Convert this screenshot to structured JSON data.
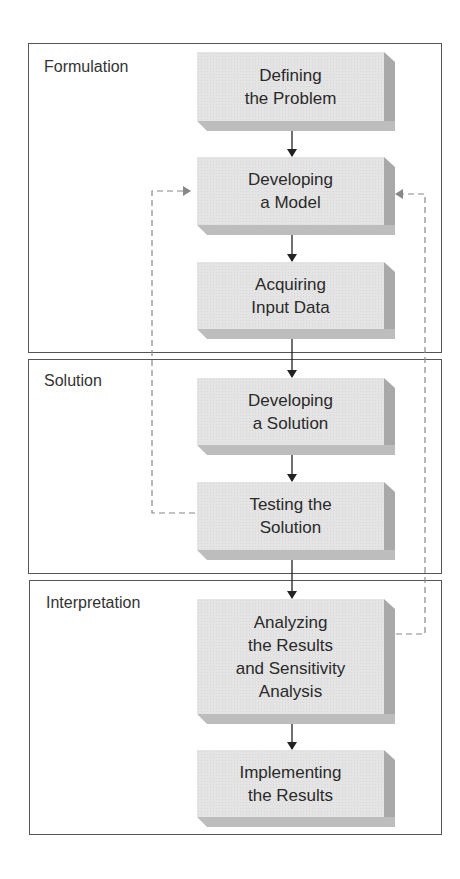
{
  "phases": [
    {
      "label": "Formulation"
    },
    {
      "label": "Solution"
    },
    {
      "label": "Interpretation"
    }
  ],
  "steps": [
    {
      "label": "Defining\nthe Problem"
    },
    {
      "label": "Developing\na Model"
    },
    {
      "label": "Acquiring\nInput Data"
    },
    {
      "label": "Developing\na Solution"
    },
    {
      "label": "Testing the\nSolution"
    },
    {
      "label": "Analyzing\nthe Results\nand Sensitivity\nAnalysis"
    },
    {
      "label": "Implementing\nthe Results"
    }
  ],
  "edges": [
    {
      "from": "Defining the Problem",
      "to": "Developing a Model",
      "style": "solid"
    },
    {
      "from": "Developing a Model",
      "to": "Acquiring Input Data",
      "style": "solid"
    },
    {
      "from": "Acquiring Input Data",
      "to": "Developing a Solution",
      "style": "solid"
    },
    {
      "from": "Developing a Solution",
      "to": "Testing the Solution",
      "style": "solid"
    },
    {
      "from": "Testing the Solution",
      "to": "Analyzing the Results and Sensitivity Analysis",
      "style": "solid"
    },
    {
      "from": "Analyzing the Results and Sensitivity Analysis",
      "to": "Implementing the Results",
      "style": "solid"
    },
    {
      "from": "Testing the Solution",
      "to": "Developing a Model",
      "style": "dashed"
    },
    {
      "from": "Analyzing the Results and Sensitivity Analysis",
      "to": "Developing a Model",
      "style": "dashed"
    }
  ],
  "colors": {
    "box_face": "#e4e4e4",
    "box_side": "#a9a9a9",
    "frame": "#555555",
    "dashed": "#888888",
    "arrow": "#222222"
  }
}
